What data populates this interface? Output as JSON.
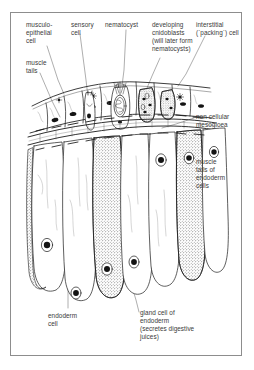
{
  "figure": {
    "style": "line drawing, black ink on white, framed"
  },
  "frame": {
    "border_color": "#8d8d8d",
    "background": "#ffffff"
  },
  "labels": [
    {
      "id": "musculo-epithelial-cell",
      "text": "musculo-\nepithelial\ncell",
      "x": 26,
      "y": 21
    },
    {
      "id": "sensory-cell",
      "text": "sensory\ncell",
      "x": 71,
      "y": 21
    },
    {
      "id": "nematocyst",
      "text": "nematocyst",
      "x": 105,
      "y": 21
    },
    {
      "id": "developing-cnidoblasts",
      "text": "developing\ncnidoblasts\n(will later form\nnematocysts)",
      "x": 152,
      "y": 21
    },
    {
      "id": "interstitial-cell",
      "text": "interstitial\n(`packing`) cell",
      "x": 196,
      "y": 21
    },
    {
      "id": "muscle-tails",
      "text": "muscle\ntails",
      "x": 26,
      "y": 59
    },
    {
      "id": "non-cellular-mesogloea",
      "text": "non cellular\nmesogloea",
      "x": 196,
      "y": 113
    },
    {
      "id": "muscle-tails-endoderm",
      "text": "muscle\ntails of\nendoderm\ncells",
      "x": 196,
      "y": 158
    },
    {
      "id": "endoderm-cell",
      "text": "endoderm\ncell",
      "x": 48,
      "y": 312
    },
    {
      "id": "gland-cell-of-endoderm",
      "text": "gland cell of\nendoderm\n(secretes digestive\njuices)",
      "x": 140,
      "y": 309
    }
  ],
  "structures": [
    {
      "id": "ectoderm-layer",
      "name": "ectoderm (outer cell layer)"
    },
    {
      "id": "mesogloea-layer",
      "name": "non cellular mesogloea"
    },
    {
      "id": "endoderm-layer",
      "name": "endoderm (inner cell layer)"
    },
    {
      "id": "nematocyst-capsule",
      "name": "nematocyst capsule with coiled thread"
    },
    {
      "id": "gland-cell",
      "name": "stippled gland cell"
    }
  ],
  "colors": {
    "ink": "#1a1a1a",
    "leader": "#5a5a5a",
    "text": "#3a3a3a",
    "paper": "#ffffff",
    "frame": "#8d8d8d"
  }
}
